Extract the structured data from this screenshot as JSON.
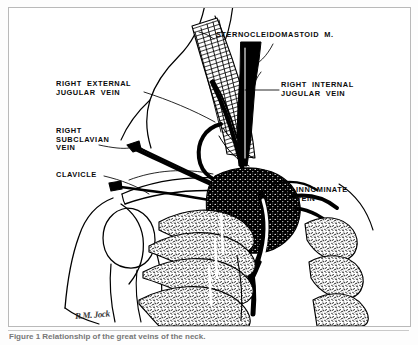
{
  "figure": {
    "kind": "anatomical-line-drawing",
    "frame_color": "#b9b9b9",
    "ink_color": "#000000",
    "background_color": "#ffffff"
  },
  "labels": {
    "sternocleidomastoid": "STERNOCLEIDOMASTOID  M.",
    "right_internal_jugular": "RIGHT  INTERNAL\nJUGULAR  VEIN",
    "right_external_jugular": "RIGHT  EXTERNAL\nJUGULAR  VEIN",
    "right_subclavian": "RIGHT\nSUBCLAVIAN\nVEIN",
    "clavicle": "CLAVICLE",
    "innominate": "INNOMINATE\nVEIN"
  },
  "signature": "R.M. Jock",
  "caption": "Figure 1 Relationship of the great veins of the neck."
}
